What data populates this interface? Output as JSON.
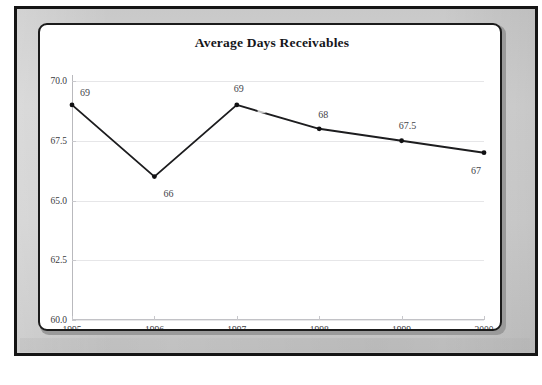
{
  "chart_data": {
    "type": "line",
    "title": "Average Days Receivables",
    "xlabel": "",
    "ylabel": "",
    "categories": [
      "1995",
      "1996",
      "1997",
      "1998",
      "1999",
      "2000"
    ],
    "values": [
      69,
      66,
      69,
      68,
      67.5,
      67
    ],
    "point_labels": [
      "69",
      "66",
      "69",
      "68",
      "67.5",
      "67"
    ],
    "ylim": [
      60.0,
      70.0
    ],
    "yticks": [
      "60.0",
      "62.5",
      "65.0",
      "67.5",
      "70.0"
    ],
    "ytick_values": [
      60.0,
      62.5,
      65.0,
      67.5,
      70.0
    ],
    "xticks": [
      "1995",
      "1996",
      "1997",
      "1998",
      "1999",
      "2000"
    ],
    "grid": "horizontal",
    "legend": "none",
    "series": [
      {
        "name": "Average Days Receivables",
        "values": [
          69,
          66,
          69,
          68,
          67.5,
          67
        ]
      }
    ],
    "colors": {
      "line": "#1d1d1f",
      "marker": "#111113",
      "grid": "#e6e6e8",
      "axis": "#b9b9bd",
      "tick_text": "#3a3a40",
      "label_text": "#44444a",
      "title_text": "#15161a",
      "plot_background": "#ffffff",
      "mat": "#cfcfcf",
      "frame": "#151515"
    }
  }
}
